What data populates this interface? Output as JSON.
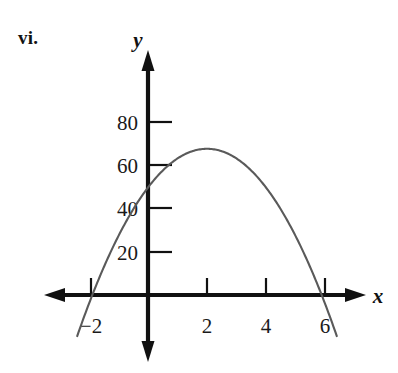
{
  "figure": {
    "item_label": "vi.",
    "background_color": "#ffffff",
    "axis_color": "#111111",
    "curve_color": "#5a5a5a"
  },
  "axes": {
    "x_axis_name": "x",
    "y_axis_name": "y",
    "x_arrow_left_icon": "arrow-left-icon",
    "x_arrow_right_icon": "arrow-right-icon",
    "y_arrow_up_icon": "arrow-up-icon",
    "y_arrow_down_icon": "arrow-down-icon"
  },
  "chart_data": {
    "type": "line",
    "title": "vi.",
    "xlabel": "x",
    "ylabel": "y",
    "grid": false,
    "legend": "none",
    "xlim": [
      -3.4,
      7.2
    ],
    "ylim": [
      -28,
      96
    ],
    "xticks": [
      -2,
      2,
      4,
      6
    ],
    "xtick_labels": [
      "−2",
      "2",
      "4",
      "6"
    ],
    "yticks": [
      20,
      40,
      60,
      80
    ],
    "ytick_labels": [
      "20",
      "40",
      "60",
      "80"
    ],
    "series": [
      {
        "name": "parabola",
        "shape": "downward parabola",
        "equation": "y = -4.5(x - 2)^2 + 68",
        "vertex": [
          2,
          68
        ],
        "roots": [
          -1.9,
          5.9
        ],
        "y_intercept": 50,
        "x": [
          -2.4,
          -2.0,
          -1.5,
          -1.0,
          -0.5,
          0.0,
          0.5,
          1.0,
          1.5,
          2.0,
          2.5,
          3.0,
          3.5,
          4.0,
          4.5,
          5.0,
          5.5,
          6.0,
          6.4
        ],
        "y": [
          -21.2,
          -4.0,
          12.9,
          27.5,
          39.9,
          50.0,
          57.9,
          63.5,
          66.9,
          68.0,
          66.9,
          63.5,
          57.9,
          50.0,
          39.9,
          27.5,
          12.9,
          -4.0,
          -19.0
        ]
      }
    ]
  }
}
